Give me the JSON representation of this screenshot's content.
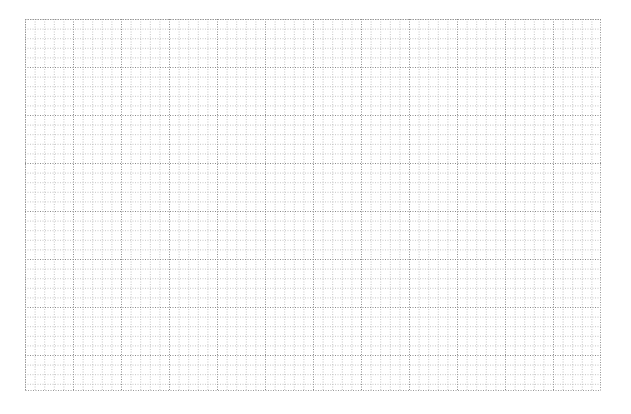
{
  "grid": {
    "left": 25,
    "top": 19,
    "width": 576,
    "height": 372,
    "cell": 9.6,
    "major_every": 5,
    "minor_color": "#b8b8b8",
    "major_color": "#8a8a8a",
    "border_color": "#9a9a9a",
    "dash": "1,1.5"
  }
}
